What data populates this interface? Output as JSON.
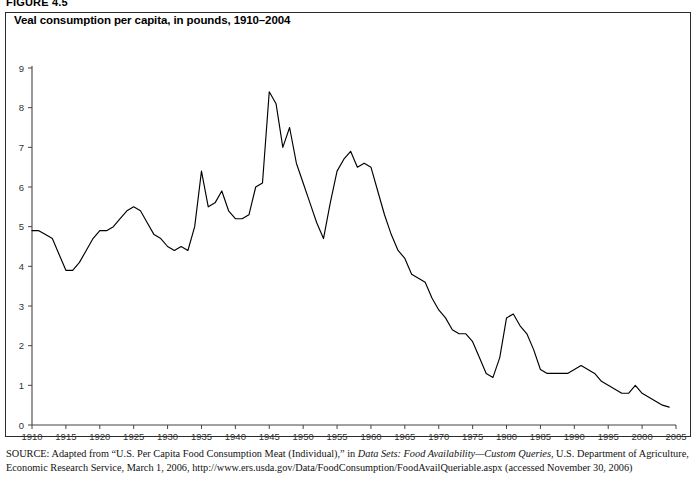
{
  "figure": {
    "number_label": "FIGURE 4.5",
    "title": "Veal consumption per capita, in pounds, 1910–2004"
  },
  "source": {
    "label": "SOURCE:",
    "text_part1": " Adapted from “U.S. Per Capita Food Consumption Meat (Individual),” in ",
    "italic1": "Data Sets: Food Availability—Custom Queries",
    "text_part2": ", U.S. Department of Agriculture, Economic Research Service, March 1, 2006, http://www.ers.usda.gov/Data/FoodConsumption/FoodAvailQueriable.aspx (accessed November 30, 2006)"
  },
  "chart_data": {
    "type": "line",
    "title": "Veal consumption per capita, in pounds, 1910–2004",
    "xlabel": "",
    "ylabel": "",
    "xlim": [
      1910,
      2005
    ],
    "ylim": [
      0,
      9
    ],
    "grid": false,
    "legend": null,
    "line_color": "#000000",
    "y_ticks": [
      "0",
      "1",
      "2",
      "3",
      "4",
      "5",
      "6",
      "7",
      "8",
      "9"
    ],
    "y_tick_values": [
      0,
      1,
      2,
      3,
      4,
      5,
      6,
      7,
      8,
      9
    ],
    "x_ticks": [
      "1910",
      "1915",
      "1920",
      "1925",
      "1930",
      "1935",
      "1940",
      "1945",
      "1950",
      "1955",
      "1960",
      "1965",
      "1970",
      "1975",
      "1980",
      "1985",
      "1990",
      "1995",
      "2000",
      "2005"
    ],
    "x_tick_values": [
      1910,
      1915,
      1920,
      1925,
      1930,
      1935,
      1940,
      1945,
      1950,
      1955,
      1960,
      1965,
      1970,
      1975,
      1980,
      1985,
      1990,
      1995,
      2000,
      2005
    ],
    "series": [
      {
        "name": "Veal consumption per capita (pounds)",
        "x": [
          1910,
          1911,
          1912,
          1913,
          1914,
          1915,
          1916,
          1917,
          1918,
          1919,
          1920,
          1921,
          1922,
          1923,
          1924,
          1925,
          1926,
          1927,
          1928,
          1929,
          1930,
          1931,
          1932,
          1933,
          1934,
          1935,
          1936,
          1937,
          1938,
          1939,
          1940,
          1941,
          1942,
          1943,
          1944,
          1945,
          1946,
          1947,
          1948,
          1949,
          1950,
          1951,
          1952,
          1953,
          1954,
          1955,
          1956,
          1957,
          1958,
          1959,
          1960,
          1961,
          1962,
          1963,
          1964,
          1965,
          1966,
          1967,
          1968,
          1969,
          1970,
          1971,
          1972,
          1973,
          1974,
          1975,
          1976,
          1977,
          1978,
          1979,
          1980,
          1981,
          1982,
          1983,
          1984,
          1985,
          1986,
          1987,
          1988,
          1989,
          1990,
          1991,
          1992,
          1993,
          1994,
          1995,
          1996,
          1997,
          1998,
          1999,
          2000,
          2001,
          2002,
          2003,
          2004
        ],
        "values": [
          4.9,
          4.9,
          4.8,
          4.7,
          4.3,
          3.9,
          3.9,
          4.1,
          4.4,
          4.7,
          4.9,
          4.9,
          5.0,
          5.2,
          5.4,
          5.5,
          5.4,
          5.1,
          4.8,
          4.7,
          4.5,
          4.4,
          4.5,
          4.4,
          5.0,
          6.4,
          5.5,
          5.6,
          5.9,
          5.4,
          5.2,
          5.2,
          5.3,
          6.0,
          6.1,
          8.4,
          8.1,
          7.0,
          7.5,
          6.6,
          6.1,
          5.6,
          5.1,
          4.7,
          5.6,
          6.4,
          6.7,
          6.9,
          6.5,
          6.6,
          6.5,
          5.9,
          5.3,
          4.8,
          4.4,
          4.2,
          3.8,
          3.7,
          3.6,
          3.2,
          2.9,
          2.7,
          2.4,
          2.3,
          2.3,
          2.1,
          1.7,
          1.3,
          1.2,
          1.7,
          2.7,
          2.8,
          2.5,
          2.3,
          1.9,
          1.4,
          1.3,
          1.3,
          1.3,
          1.3,
          1.4,
          1.5,
          1.4,
          1.3,
          1.1,
          1.0,
          0.9,
          0.8,
          0.8,
          1.0,
          0.8,
          0.7,
          0.6,
          0.5,
          0.45
        ]
      }
    ]
  }
}
